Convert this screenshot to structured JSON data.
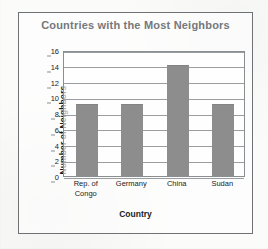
{
  "chart_data": {
    "type": "bar",
    "title": "Countries with the Most Neighbors",
    "xlabel": "Country",
    "ylabel": "Number of Neighbors",
    "categories": [
      "Rep. of Congo",
      "Germany",
      "China",
      "Sudan"
    ],
    "category_lines": [
      [
        "Rep. of",
        "Congo"
      ],
      [
        "Germany"
      ],
      [
        "China"
      ],
      [
        "Sudan"
      ]
    ],
    "values": [
      9,
      9,
      14,
      9
    ],
    "ylim": [
      0,
      16
    ],
    "ytick_step": 2,
    "yticks": [
      0,
      2,
      4,
      6,
      8,
      10,
      12,
      14,
      16
    ],
    "ytick_labels": [
      "0",
      "2",
      "4",
      "6",
      "8",
      "10",
      "12",
      "14",
      "16"
    ],
    "grid": true,
    "legend": false,
    "bar_color": "#8d8d8d",
    "title_color": "#75787c",
    "axis_color": "#8b8e91",
    "grid_color": "#9a9da0",
    "frame_color": "#6f7275"
  }
}
